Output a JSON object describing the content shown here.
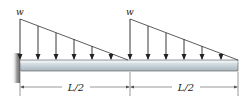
{
  "diagram": {
    "type": "cantilever-beam-distributed-load",
    "labels": {
      "load_left": "w",
      "load_right": "w",
      "span_left": "L/2",
      "span_right": "L/2"
    },
    "loads": [
      {
        "name": "triangular-load-left",
        "peak_label": "w",
        "peak_at": "left",
        "x_start": 20,
        "x_end": 128,
        "arrow_x": [
          20,
          38,
          56,
          74,
          92,
          111
        ]
      },
      {
        "name": "triangular-load-right",
        "peak_label": "w",
        "peak_at": "left",
        "x_start": 130,
        "x_end": 238,
        "arrow_x": [
          130,
          148,
          166,
          184,
          202,
          221
        ]
      }
    ],
    "colors": {
      "line": "#333333",
      "beam_top": "#e4ebef",
      "beam_mid": "#c7d2d8",
      "beam_bottom": "#a9b6be",
      "wall": "#8c8c8c",
      "dimension": "#555555"
    }
  }
}
